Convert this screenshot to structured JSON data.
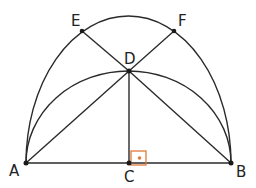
{
  "diagram": {
    "type": "geometry",
    "colors": {
      "stroke": "#2a2a2a",
      "right_angle_marker": "#e07a3a"
    },
    "points": [
      {
        "id": "A",
        "label": "A",
        "x": 26,
        "y": 163
      },
      {
        "id": "B",
        "label": "B",
        "x": 231,
        "y": 163
      },
      {
        "id": "C",
        "label": "C",
        "x": 129,
        "y": 163
      },
      {
        "id": "D",
        "label": "D",
        "x": 129,
        "y": 71
      },
      {
        "id": "E",
        "label": "E",
        "x": 82,
        "y": 31
      },
      {
        "id": "F",
        "label": "F",
        "x": 174,
        "y": 31
      }
    ],
    "segments": [
      "AB",
      "CD",
      "AD",
      "BD",
      "BE",
      "AF"
    ],
    "arcs": [
      "outer arc A-E-F-B",
      "inner arc A-D-B"
    ],
    "right_angle_at": "C"
  }
}
